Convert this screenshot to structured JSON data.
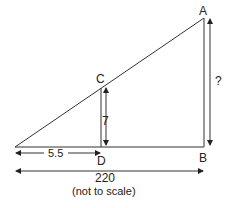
{
  "diagram": {
    "points": {
      "A": "A",
      "B": "B",
      "C": "C",
      "D": "D"
    },
    "labels": {
      "cd_length": "7",
      "ab_length": "?",
      "base_small": "5.5",
      "base_total": "220",
      "note": "(not to scale)"
    },
    "colors": {
      "line": "#333333",
      "text": "#222222"
    }
  }
}
